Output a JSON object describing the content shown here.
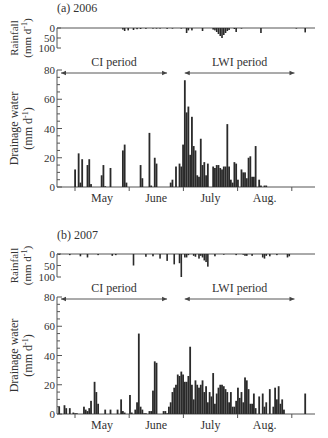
{
  "chart_data": [
    {
      "type": "bar",
      "panel_label": "(a) 2006",
      "xlabel": "",
      "month_labels": [
        "May",
        "June",
        "July",
        "Aug."
      ],
      "rainfall": {
        "ylabel": "Rainfall (mm d-1)",
        "ylim": [
          0,
          100
        ],
        "yticks": [
          0,
          50,
          100
        ],
        "inverted": true,
        "days": [
          27,
          28,
          30,
          33,
          35,
          37,
          40,
          44,
          46,
          48,
          52,
          55,
          60,
          63,
          64,
          66,
          72,
          78,
          79,
          80,
          81,
          82,
          83,
          84,
          85,
          86,
          87,
          90,
          91,
          94,
          105,
          125,
          130
        ],
        "values": [
          8,
          15,
          12,
          10,
          6,
          5,
          4,
          3,
          3,
          3,
          4,
          3,
          3,
          25,
          12,
          12,
          15,
          8,
          12,
          20,
          30,
          40,
          50,
          35,
          25,
          15,
          10,
          5,
          20,
          3,
          25,
          3,
          22
        ]
      },
      "drainage": {
        "ylabel": "Drainage water (mm d-1)",
        "ylim": [
          0,
          80
        ],
        "yticks": [
          0,
          20,
          40,
          60,
          80
        ],
        "days": [
          0,
          2,
          3,
          4,
          7,
          8,
          9,
          15,
          16,
          17,
          20,
          27,
          28,
          29,
          37,
          38,
          42,
          43,
          45,
          46,
          54,
          55,
          57,
          59,
          60,
          61,
          62,
          63,
          64,
          65,
          66,
          67,
          68,
          69,
          70,
          71,
          72,
          73,
          74,
          75,
          78,
          79,
          80,
          81,
          82,
          83,
          84,
          85,
          86,
          87,
          88,
          89,
          90,
          91,
          92,
          94,
          95,
          96,
          97,
          98,
          99,
          100,
          101,
          102,
          104,
          105,
          107,
          108
        ],
        "values": [
          12,
          23,
          3,
          19,
          15,
          19,
          2,
          8,
          15,
          0.5,
          13,
          25,
          29,
          3,
          15,
          6,
          37,
          1,
          20,
          16,
          3,
          5,
          14,
          16,
          14,
          29,
          73,
          51,
          55,
          22,
          48,
          28,
          25,
          8,
          7,
          33,
          15,
          17,
          8,
          16,
          14,
          13,
          15,
          15,
          13,
          12,
          14,
          14,
          43,
          14,
          5,
          3,
          17,
          16,
          5,
          12,
          10,
          10,
          6,
          20,
          21,
          7,
          7,
          28,
          5,
          1,
          1,
          1
        ],
        "periods": [
          {
            "label": "CI period",
            "start_day": -10,
            "end_day": 52
          },
          {
            "label": "LWI period",
            "start_day": 62,
            "end_day": 124
          }
        ]
      }
    },
    {
      "type": "bar",
      "panel_label": "(b) 2007",
      "xlabel": "",
      "month_labels": [
        "May",
        "June",
        "July",
        "Aug."
      ],
      "rainfall": {
        "ylabel": "Rainfall (mm d-1)",
        "ylim": [
          0,
          100
        ],
        "yticks": [
          0,
          50,
          100
        ],
        "inverted": true,
        "days": [
          -9,
          -3,
          3,
          7,
          13,
          21,
          23,
          33,
          40,
          44,
          48,
          52,
          56,
          59,
          60,
          62,
          63,
          64,
          67,
          68,
          70,
          71,
          72,
          73,
          74,
          75,
          79,
          84,
          91,
          95,
          96,
          97,
          100,
          106,
          107,
          108,
          110,
          114,
          120,
          121
        ],
        "values": [
          3,
          5,
          10,
          15,
          5,
          8,
          5,
          50,
          12,
          10,
          20,
          30,
          45,
          40,
          100,
          15,
          15,
          5,
          8,
          12,
          20,
          8,
          15,
          28,
          35,
          55,
          10,
          3,
          5,
          3,
          8,
          8,
          8,
          15,
          20,
          8,
          10,
          5,
          15,
          10
        ]
      },
      "drainage": {
        "ylabel": "Drainage water (mm d-1)",
        "ylim": [
          0,
          80
        ],
        "yticks": [
          0,
          20,
          40,
          60,
          80
        ],
        "days": [
          -9,
          -6,
          -5,
          -3,
          -1,
          0,
          1,
          5,
          6,
          7,
          8,
          9,
          11,
          12,
          13,
          17,
          20,
          24,
          26,
          27,
          28,
          31,
          32,
          34,
          35,
          36,
          37,
          38,
          39,
          40,
          42,
          43,
          44,
          45,
          46,
          50,
          51,
          52,
          53,
          54,
          55,
          56,
          57,
          58,
          59,
          60,
          61,
          62,
          63,
          64,
          65,
          66,
          67,
          68,
          69,
          70,
          71,
          72,
          73,
          74,
          75,
          76,
          77,
          78,
          79,
          80,
          81,
          82,
          83,
          84,
          85,
          86,
          87,
          88,
          89,
          90,
          91,
          92,
          93,
          94,
          95,
          96,
          97,
          98,
          99,
          100,
          101,
          102,
          104,
          106,
          107,
          108,
          110,
          112,
          113,
          114,
          115,
          116,
          117,
          118,
          130
        ],
        "values": [
          5,
          6,
          4,
          4,
          1,
          0.5,
          0.5,
          5,
          3,
          2,
          4,
          9,
          22,
          15,
          7,
          3,
          3,
          3,
          10,
          2,
          1,
          13,
          1,
          3,
          8,
          55,
          5,
          3,
          0.5,
          0.5,
          2,
          2,
          16,
          36,
          35,
          2,
          2,
          0.5,
          5,
          8,
          15,
          18,
          20,
          27,
          26,
          29,
          27,
          22,
          22,
          26,
          46,
          20,
          10,
          23,
          20,
          18,
          20,
          23,
          15,
          19,
          8,
          15,
          12,
          28,
          7,
          14,
          18,
          20,
          20,
          19,
          17,
          15,
          8,
          15,
          5,
          5,
          9,
          18,
          11,
          15,
          8,
          25,
          23,
          17,
          7,
          7,
          14,
          4,
          12,
          14,
          5,
          8,
          17,
          5,
          18,
          10,
          19,
          7,
          10,
          3,
          14
        ],
        "periods": [
          {
            "label": "CI period",
            "start_day": -10,
            "end_day": 52
          },
          {
            "label": "LWI period",
            "start_day": 62,
            "end_day": 124
          }
        ]
      }
    }
  ],
  "x_axis_note": "Daily bars, day 0 = May 1; month boundary ticks at May 1, Jun 1, Jul 1, Aug 1, Sep 1"
}
